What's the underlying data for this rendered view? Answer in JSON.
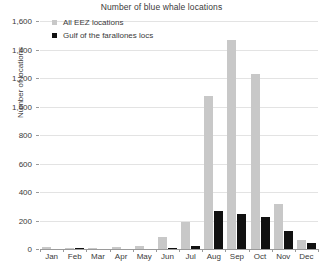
{
  "chart_data": {
    "type": "bar",
    "title": "Number of blue whale locations",
    "xlabel": "",
    "ylabel": "Number of locations",
    "categories": [
      "Jan",
      "Feb",
      "Mar",
      "Apr",
      "May",
      "Jun",
      "Jul",
      "Aug",
      "Sep",
      "Oct",
      "Nov",
      "Dec"
    ],
    "series": [
      {
        "name": "All EEZ locations",
        "color": "#c8c8c8",
        "values": [
          12,
          4,
          3,
          14,
          18,
          85,
          190,
          1075,
          1465,
          1225,
          315,
          65
        ]
      },
      {
        "name": "Gulf of the farallones locs",
        "color": "#111111",
        "values": [
          0,
          6,
          0,
          0,
          0,
          2,
          18,
          268,
          243,
          228,
          126,
          40
        ]
      }
    ],
    "ylim": [
      0,
      1600
    ],
    "ytick_step": 200,
    "ytick_labels": [
      "0",
      "200",
      "400",
      "600",
      "800",
      "1,000",
      "1,200",
      "1,400",
      "1,600"
    ],
    "grid": true,
    "legend_position": "top-left"
  },
  "legend": {
    "items": [
      {
        "label": "All EEZ locations",
        "swatch": "eez"
      },
      {
        "label": "Gulf of the farallones locs",
        "swatch": "gulf"
      }
    ]
  },
  "colors": {
    "eez_bar": "#c8c8c8",
    "gulf_bar": "#111111",
    "gridline": "#e3e3e3",
    "axis": "#9a9a9a",
    "text": "#3a3a3a",
    "background": "#ffffff"
  }
}
